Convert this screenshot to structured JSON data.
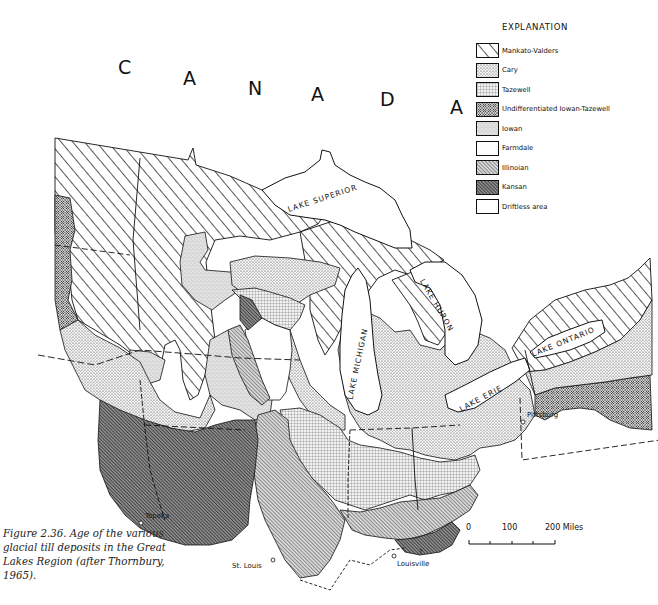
{
  "figure": {
    "caption": "Figure 2.36.  Age of the various glacial till deposits in the Great Lakes Region (after Thornbury, 1965)."
  },
  "map": {
    "country_label": [
      "C",
      "A",
      "N",
      "A",
      "D",
      "A"
    ],
    "lakes": [
      {
        "name": "LAKE SUPERIOR"
      },
      {
        "name": "LAKE MICHIGAN"
      },
      {
        "name": "LAKE HURON"
      },
      {
        "name": "LAKE ERIE"
      },
      {
        "name": "LAKE ONTARIO"
      }
    ],
    "cities": [
      {
        "name": "Topeka"
      },
      {
        "name": "St. Louis"
      },
      {
        "name": "Louisville"
      },
      {
        "name": "Pittsburg"
      }
    ],
    "uncertain_marker": "?"
  },
  "legend": {
    "title": "EXPLANATION",
    "items": [
      {
        "label": "Mankato-Valders",
        "pattern": "wide-diagonal-hatch"
      },
      {
        "label": "Cary",
        "pattern": "dense-stipple"
      },
      {
        "label": "Tazewell",
        "pattern": "fine-grid"
      },
      {
        "label": "Undifferentiated Iowan-Tazewell",
        "pattern": "crosshatch-circles"
      },
      {
        "label": "Iowan",
        "pattern": "light-stipple"
      },
      {
        "label": "Farmdale",
        "pattern": "blank"
      },
      {
        "label": "Illinoian",
        "pattern": "fine-diagonal-hatch"
      },
      {
        "label": "Kansan",
        "pattern": "dark-diagonal-hatch"
      },
      {
        "label": "Driftless area",
        "pattern": "blank"
      }
    ]
  },
  "scale_bar": {
    "ticks": [
      "0",
      "100",
      "200 Miles"
    ],
    "unit": "Miles"
  },
  "colors": {
    "ink": "#111111",
    "paper": "#ffffff"
  }
}
